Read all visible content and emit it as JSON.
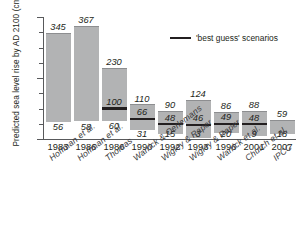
{
  "chart_data": {
    "type": "bar",
    "title": "",
    "subtitle": "",
    "xlabel": "",
    "ylabel": "Predicted sea level rise by AD 2100 (cm)",
    "ylim": [
      0,
      400
    ],
    "ytick_labels": [
      "0",
      "200",
      "400"
    ],
    "ytick_values": [
      0,
      200,
      400
    ],
    "minor_tick_step": 50,
    "grid": false,
    "legend_position": "top-right",
    "legend": [
      {
        "label": "'best guess' scenarios",
        "marker": "line",
        "color": "#231f20"
      }
    ],
    "bar_color": "#b2b3b4",
    "categories": [
      "1983",
      "1986",
      "1986",
      "1990",
      "1992",
      "1993",
      "1996",
      "2001",
      "2007"
    ],
    "category_sources": [
      "Hoffman et al.",
      "Hoffman et al.",
      "Thomas",
      "Warrick & Oerlemans",
      "Wigley & Raper",
      "Wigley & Raper",
      "Warrick et al.",
      "Church et al.",
      "IPCC"
    ],
    "series": [
      {
        "name": "high estimate",
        "values": [
          345,
          367,
          230,
          110,
          90,
          124,
          86,
          88,
          59
        ]
      },
      {
        "name": "low estimate",
        "values": [
          56,
          58,
          60,
          31,
          15,
          3,
          20,
          9,
          18
        ]
      },
      {
        "name": "'best guess' scenarios",
        "values": [
          null,
          null,
          100,
          66,
          48,
          46,
          49,
          48,
          null
        ]
      }
    ],
    "bars": [
      {
        "year": "1983",
        "source": "Hoffman et al.",
        "high": 345,
        "low": 56,
        "best_guess": null
      },
      {
        "year": "1986",
        "source": "Hoffman et al.",
        "high": 367,
        "low": 58,
        "best_guess": null
      },
      {
        "year": "1986",
        "source": "Thomas",
        "high": 230,
        "low": 60,
        "best_guess": 100
      },
      {
        "year": "1990",
        "source": "Warrick & Oerlemans",
        "high": 110,
        "low": 31,
        "best_guess": 66
      },
      {
        "year": "1992",
        "source": "Wigley & Raper",
        "high": 90,
        "low": 15,
        "best_guess": 48
      },
      {
        "year": "1993",
        "source": "Wigley & Raper",
        "high": 124,
        "low": 3,
        "best_guess": 46
      },
      {
        "year": "1996",
        "source": "Warrick et al.",
        "high": 86,
        "low": 20,
        "best_guess": 49
      },
      {
        "year": "2001",
        "source": "Church et al.",
        "high": 88,
        "low": 9,
        "best_guess": 48
      },
      {
        "year": "2007",
        "source": "IPCC",
        "high": 59,
        "low": 18,
        "best_guess": null
      }
    ],
    "labels": {
      "high": [
        "345",
        "367",
        "230",
        "110",
        "90",
        "124",
        "86",
        "88",
        "59"
      ],
      "low": [
        "56",
        "58",
        "60",
        "31",
        "15",
        "3",
        "20",
        "9",
        "18"
      ],
      "best_guess": [
        "",
        "",
        "100",
        "66",
        "48",
        "46",
        "49",
        "48",
        ""
      ]
    }
  }
}
